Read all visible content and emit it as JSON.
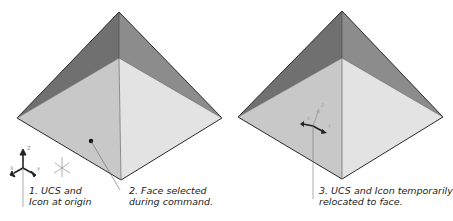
{
  "figure": {
    "panels": [
      {
        "id": "left",
        "description": "Pyramid with UCS at world origin"
      },
      {
        "id": "right",
        "description": "Pyramid with UCS relocated to selected face"
      }
    ],
    "callouts": [
      {
        "number": "1.",
        "line1": "1. UCS and",
        "line2": "Icon at origin"
      },
      {
        "number": "2.",
        "line1": "2. Face selected",
        "line2": "during command."
      },
      {
        "number": "3.",
        "line1": "3. UCS and Icon temporarily",
        "line2": "relocated to face."
      }
    ],
    "icons": {
      "ucs_origin": "ucs-axes-icon",
      "world_axes": "world-axes-icon",
      "ucs_face": "ucs-axes-icon",
      "face_pick_point": "pick-point-icon"
    },
    "axis_labels": {
      "x": "X",
      "y": "Y",
      "z": "Z"
    },
    "colors": {
      "face_dark": "#6e6e6e",
      "face_dark_right": "#8a8a8a",
      "face_light_left": "#c9c9c9",
      "face_light_right": "#e2e2e2",
      "edge": "#2a2a2a",
      "leader": "#777777",
      "text": "#222222"
    }
  }
}
